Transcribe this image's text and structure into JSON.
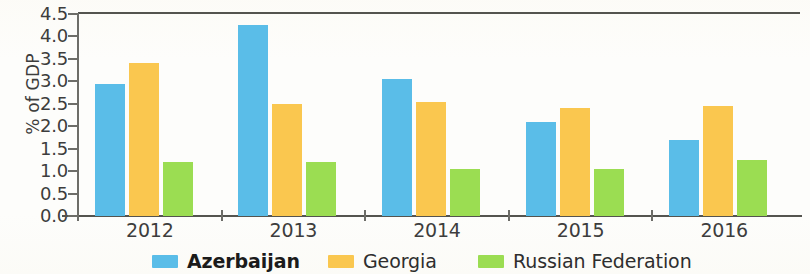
{
  "chart_data": {
    "type": "bar",
    "title": "",
    "xlabel": "",
    "ylabel": "% of GDP",
    "categories": [
      "2012",
      "2013",
      "2014",
      "2015",
      "2016"
    ],
    "series": [
      {
        "name": "Azerbaijan",
        "color": "#5ABDE8",
        "values": [
          2.95,
          4.25,
          3.05,
          2.1,
          1.7
        ]
      },
      {
        "name": "Georgia",
        "color": "#FAC74F",
        "values": [
          3.4,
          2.5,
          2.55,
          2.4,
          2.45
        ]
      },
      {
        "name": "Russian Federation",
        "color": "#9BDD52",
        "values": [
          1.2,
          1.2,
          1.05,
          1.05,
          1.25
        ]
      }
    ],
    "ylim": [
      0.0,
      4.5
    ],
    "ytick_labels": [
      "4.5",
      "4.0",
      "3.5",
      "3.0",
      "2.5",
      "2.0",
      "1.5",
      "1.0",
      "0.5",
      "0.0"
    ],
    "ytick_values": [
      4.5,
      4.0,
      3.5,
      3.0,
      2.5,
      2.0,
      1.5,
      1.0,
      0.5,
      0.0
    ],
    "grid": false,
    "legend_position": "bottom",
    "legend": [
      {
        "label": "Azerbaijan",
        "color": "#5ABDE8",
        "bold": true
      },
      {
        "label": "Georgia",
        "color": "#FAC74F",
        "bold": false
      },
      {
        "label": "Russian Federation",
        "color": "#9BDD52",
        "bold": false
      }
    ]
  },
  "axis": {
    "y_title": "% of GDP"
  },
  "colors": {
    "azerbaijan": "#5ABDE8",
    "georgia": "#FAC74F",
    "russian_federation": "#9BDD52",
    "axis": "#54544F",
    "text": "#3D3D3D"
  }
}
